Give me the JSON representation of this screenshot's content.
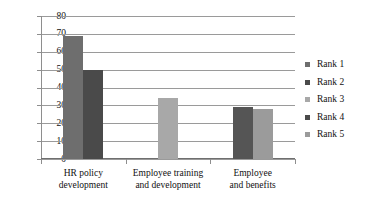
{
  "chart_data": {
    "type": "bar",
    "title": "",
    "xlabel": "",
    "ylabel": "",
    "ylim": [
      0,
      80
    ],
    "ytick_step": 10,
    "yticks": [
      "80",
      "70",
      "60",
      "50",
      "40",
      "30",
      "20",
      "10",
      "0"
    ],
    "grid": true,
    "legend_position": "right",
    "categories": [
      "HR policy development",
      "Employee training and development",
      "Employee and benefits"
    ],
    "category_lines": [
      [
        "HR policy",
        "development"
      ],
      [
        "Employee training",
        "and development"
      ],
      [
        "Employee",
        "and benefits"
      ]
    ],
    "series": [
      {
        "name": "Rank 1",
        "color": "#6e6e6e",
        "values": [
          69,
          null,
          null
        ]
      },
      {
        "name": "Rank 2",
        "color": "#4a4a4a",
        "values": [
          50,
          null,
          29
        ]
      },
      {
        "name": "Rank 3",
        "color": "#a8a8a8",
        "values": [
          null,
          34,
          null
        ]
      },
      {
        "name": "Rank 4",
        "color": "#4a4a4a",
        "values": [
          null,
          null,
          null
        ]
      },
      {
        "name": "Rank 5",
        "color": "#9b9b9b",
        "values": [
          null,
          null,
          28
        ]
      }
    ],
    "bars": [
      {
        "category_index": 0,
        "series": "Rank 1",
        "value": 69,
        "color": "#6e6e6e"
      },
      {
        "category_index": 0,
        "series": "Rank 2",
        "value": 50,
        "color": "#4a4a4a"
      },
      {
        "category_index": 1,
        "series": "Rank 3",
        "value": 34,
        "color": "#a8a8a8"
      },
      {
        "category_index": 2,
        "series": "Rank 2",
        "value": 29,
        "color": "#555555"
      },
      {
        "category_index": 2,
        "series": "Rank 5",
        "value": 28,
        "color": "#9b9b9b"
      }
    ]
  },
  "legend": {
    "items": [
      {
        "label": "Rank 1",
        "color": "#6e6e6e"
      },
      {
        "label": "Rank 2",
        "color": "#4a4a4a"
      },
      {
        "label": "Rank 3",
        "color": "#a8a8a8"
      },
      {
        "label": "Rank 4",
        "color": "#4a4a4a"
      },
      {
        "label": "Rank 5",
        "color": "#9b9b9b"
      }
    ]
  },
  "colors": {
    "grid": "#9a9a9a",
    "axis": "#8e8e8e",
    "text": "#111111",
    "background": "#ffffff"
  }
}
